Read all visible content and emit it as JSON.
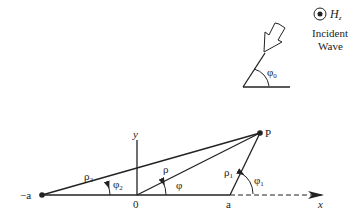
{
  "incident_wave": {
    "field_label": "H",
    "field_subscript": "z",
    "caption_line1": "Incident",
    "caption_line2": "Wave",
    "angle_label": "φ",
    "angle_subscript": "0"
  },
  "geometry": {
    "point_label": "P",
    "neg_a_label": "−a",
    "origin_label": "0",
    "a_label": "a",
    "x_axis_label": "x",
    "y_axis_label": "y",
    "rho_label": "ρ",
    "rho1_label": "ρ",
    "rho1_sub": "1",
    "rho2_label": "ρ",
    "rho2_sub": "2",
    "phi_label": "φ",
    "phi1_label": "φ",
    "phi1_sub": "1",
    "phi2_label": "φ",
    "phi2_sub": "2"
  },
  "colors": {
    "line": "#222222",
    "background": "#ffffff"
  }
}
